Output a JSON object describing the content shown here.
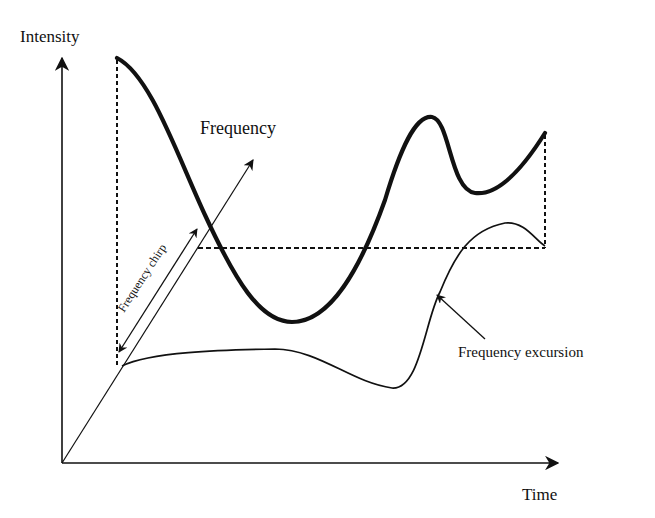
{
  "diagram": {
    "title": "",
    "axes": {
      "y_label": "Intensity",
      "x_label": "Time",
      "z_label": "Frequency"
    },
    "annotations": {
      "chirp": "Frequency chirp",
      "excursion": "Frequency excursion"
    },
    "curves": [
      {
        "name": "intensity",
        "style": "thick"
      },
      {
        "name": "frequency",
        "style": "thin"
      }
    ],
    "colors": {
      "ink": "#111111",
      "background": "#ffffff"
    }
  }
}
